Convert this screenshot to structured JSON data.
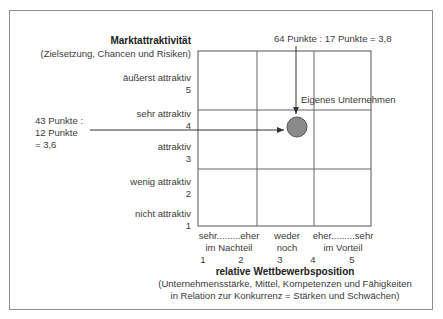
{
  "y_axis": {
    "title": "Marktattraktivität",
    "subtitle": "(Zielsetzung, Chancen und Risiken)",
    "levels": [
      {
        "label": "äußerst attraktiv",
        "value": "5"
      },
      {
        "label": "sehr attraktiv",
        "value": "4"
      },
      {
        "label": "attraktiv",
        "value": "3"
      },
      {
        "label": "wenig attraktiv",
        "value": "2"
      },
      {
        "label": "nicht attraktiv",
        "value": "1"
      }
    ]
  },
  "x_axis": {
    "title": "relative Wettbewerbsposition",
    "subtitle_line1": "(Unternehmensstärke, Mittel, Kompetenzen und Fähigkeiten",
    "subtitle_line2": "in Relation zur Konkurrenz = Stärken und Schwächen)",
    "group_labels": [
      {
        "line1": "sehr.........eher",
        "line2": "im Nachteil"
      },
      {
        "line1": "weder",
        "line2": "noch"
      },
      {
        "line1": "eher.........sehr",
        "line2": "im Vorteil"
      }
    ],
    "ticks": [
      "1",
      "2",
      "3",
      "4",
      "5"
    ]
  },
  "annotations": {
    "top": "64 Punkte : 17 Punkte = 3,8",
    "left_line1": "43 Punkte :",
    "left_line2": "12 Punkte",
    "left_line3": "= 3,6",
    "point_label": "Eigenes Unternehmen"
  },
  "point": {
    "x": 3.8,
    "y": 3.6,
    "color": "#8a8a8a"
  }
}
